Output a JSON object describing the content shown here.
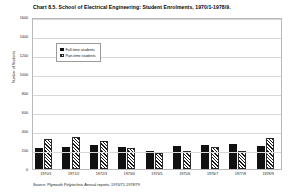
{
  "chart_data": {
    "type": "bar",
    "title": "Chart 8.5. School of Electrical Engineering: Student Enrolments, 1970/1-1978/9.",
    "xlabel": "",
    "ylabel": "Number of Students",
    "ylim": [
      0,
      1600
    ],
    "yticks": [
      0,
      200,
      400,
      600,
      800,
      1000,
      1200,
      1400,
      1600
    ],
    "ytick_labels": [
      "0",
      "200",
      "400",
      "600",
      "800",
      "1000",
      "1200",
      "1400",
      "1600"
    ],
    "grid": true,
    "legend_position": "upper-left-inside",
    "categories": [
      "1970/1",
      "1971/2",
      "1972/3",
      "1973/4",
      "1974/5",
      "1975/6",
      "1976/7",
      "1977/8",
      "1978/9"
    ],
    "series": [
      {
        "name": "Full-time students",
        "pattern": "solid",
        "color": "#111111",
        "values": [
          216,
          232,
          248,
          228,
          186,
          244,
          248,
          262,
          242
        ]
      },
      {
        "name": "Part-time students",
        "pattern": "diagonal-hatch",
        "color": "#1a1a1a",
        "values": [
          320,
          338,
          300,
          216,
          172,
          188,
          236,
          192,
          330
        ]
      }
    ],
    "source": "Source: Plymouth Polytechnic Annual reports, 1970/71-1978/79"
  }
}
